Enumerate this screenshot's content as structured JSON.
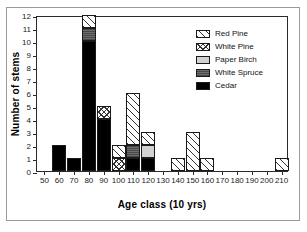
{
  "chart_data": {
    "type": "bar",
    "stacked": true,
    "title": "",
    "xlabel": "Age class (10 yrs)",
    "ylabel": "Number of stems",
    "categories": [
      "50",
      "60",
      "70",
      "80",
      "90",
      "100",
      "110",
      "120",
      "130",
      "140",
      "150",
      "160",
      "170",
      "180",
      "190",
      "200",
      "210"
    ],
    "xtick_labels": [
      "50",
      "60",
      "70",
      "80",
      "90",
      "100",
      "110",
      "120",
      "130",
      "140",
      "150",
      "160",
      "170",
      "180",
      "190",
      "200",
      "210"
    ],
    "ytick_labels": [
      "0",
      "1",
      "2",
      "3",
      "4",
      "5",
      "6",
      "7",
      "8",
      "9",
      "10",
      "11",
      "12"
    ],
    "ylim": [
      0,
      12
    ],
    "ytick_step": 1,
    "grid": false,
    "legend_position": "top-right",
    "series": [
      {
        "name": "Red Pine",
        "pattern": "diagonal-hatch",
        "color": "#ffffff",
        "values": [
          0,
          0,
          0,
          1,
          0,
          1,
          4,
          1,
          0,
          1,
          3,
          1,
          0,
          0,
          0,
          0,
          1
        ]
      },
      {
        "name": "White Pine",
        "pattern": "cross-hatch",
        "color": "#ffffff",
        "values": [
          0,
          0,
          0,
          0,
          1,
          1,
          0,
          0,
          0,
          0,
          0,
          0,
          0,
          0,
          0,
          0,
          0
        ]
      },
      {
        "name": "Paper Birch",
        "pattern": "light-gray",
        "color": "#d2d2d2",
        "values": [
          0,
          0,
          0,
          0,
          0,
          0,
          0,
          1,
          0,
          0,
          0,
          0,
          0,
          0,
          0,
          0,
          0
        ]
      },
      {
        "name": "White Spruce",
        "pattern": "dark-gray",
        "color": "#6e6e6e",
        "values": [
          0,
          0,
          0,
          1,
          0,
          0,
          1,
          0,
          0,
          0,
          0,
          0,
          0,
          0,
          0,
          0,
          0
        ]
      },
      {
        "name": "Cedar",
        "pattern": "solid-black",
        "color": "#000000",
        "values": [
          0,
          2,
          1,
          10,
          4,
          0,
          1,
          1,
          0,
          0,
          0,
          0,
          0,
          0,
          0,
          0,
          0
        ]
      }
    ],
    "totals": [
      0,
      2,
      1,
      12,
      5,
      2,
      6,
      3,
      0,
      1,
      3,
      1,
      0,
      0,
      0,
      0,
      1
    ]
  },
  "legend": {
    "items": [
      {
        "label": "Red Pine"
      },
      {
        "label": "White Pine"
      },
      {
        "label": "Paper Birch"
      },
      {
        "label": "White Spruce"
      },
      {
        "label": "Cedar"
      }
    ]
  }
}
